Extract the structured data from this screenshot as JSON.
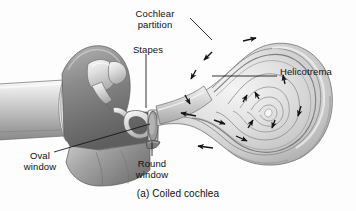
{
  "figure": {
    "caption": "(a) Coiled cochlea",
    "background_color": "#fdfdfd",
    "ink_color": "#101010",
    "style": "grayscale anatomical line illustration with airbrush shading"
  },
  "labels": {
    "cochlear_partition": "Cochlear\npartition",
    "stapes": "Stapes",
    "helicotrema": "Helicotrema",
    "oval_window": "Oval\nwindow",
    "round_window": "Round\nwindow"
  },
  "structures": [
    {
      "name": "ear-canal",
      "description": "external auditory canal tube entering from left edge"
    },
    {
      "name": "tympanic-membrane",
      "description": "eardrum, fan/cone shaped radial-striated membrane"
    },
    {
      "name": "malleus-incus",
      "description": "ossicle chain above the eardrum"
    },
    {
      "name": "stapes",
      "description": "stirrup-shaped ossicle with footplate on oval window"
    },
    {
      "name": "oval-window",
      "description": "membrane-covered opening beneath the stapes footplate"
    },
    {
      "name": "round-window",
      "description": "membrane-covered opening below the oval window"
    },
    {
      "name": "cochlea-spiral",
      "description": "coiled snail-shell cochlea of about two and a half turns"
    },
    {
      "name": "cochlear-partition",
      "description": "basilar membrane partition dividing the cochlear duct"
    },
    {
      "name": "helicotrema",
      "description": "apical opening at the spiral center joining the two scalae"
    },
    {
      "name": "bony-base",
      "description": "temporal bone base supporting the middle ear cavity"
    }
  ],
  "flow_arrows": {
    "count": 14,
    "color": "#141414",
    "meaning": "direction of travelling-wave fluid motion: inward along scala vestibuli to helicotrema, outward along scala tympani to round window"
  },
  "leaders": [
    {
      "name": "leader-cochlear-partition",
      "from_label": "cochlear_partition",
      "to_structure": "cochlear-partition"
    },
    {
      "name": "leader-stapes",
      "from_label": "stapes",
      "to_structure": "stapes"
    },
    {
      "name": "leader-helicotrema",
      "from_label": "helicotrema",
      "to_structure": "helicotrema"
    },
    {
      "name": "leader-oval-window",
      "from_label": "oval_window",
      "to_structure": "oval-window"
    },
    {
      "name": "leader-round-window",
      "from_label": "round_window",
      "to_structure": "round-window"
    }
  ],
  "palette": {
    "paper": "#fdfdfd",
    "line": "#101010",
    "tissue_light": "#e8e8e8",
    "tissue_mid": "#c4c4c4",
    "tissue_dark": "#8f8f8f",
    "tissue_shadow": "#6b6b6b",
    "bone_highlight": "#f2f2f2"
  }
}
